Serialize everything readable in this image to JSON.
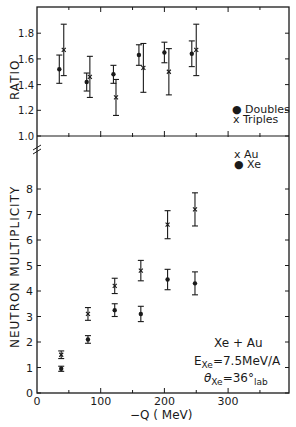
{
  "chart_data": [
    {
      "type": "scatter",
      "panel": "top",
      "title": "",
      "xlabel": "-Q (MeV)",
      "ylabel": "RATIO",
      "xlim": [
        0,
        400
      ],
      "ylim": [
        1.0,
        1.95
      ],
      "yticks": [
        "1.0",
        "1.2",
        "1.4",
        "1.6",
        "1.8"
      ],
      "grid": false,
      "legend": {
        "position": "lower right",
        "entries": [
          "Doubles",
          "Triples"
        ]
      },
      "series": [
        {
          "name": "Doubles",
          "marker": "o",
          "x": [
            35,
            78,
            120,
            160,
            200,
            243
          ],
          "y": [
            1.52,
            1.42,
            1.48,
            1.63,
            1.65,
            1.64
          ],
          "err": [
            0.11,
            0.07,
            0.07,
            0.08,
            0.08,
            0.1
          ]
        },
        {
          "name": "Triples",
          "marker": "x",
          "x": [
            42,
            83,
            124,
            167,
            207,
            250
          ],
          "y": [
            1.67,
            1.46,
            1.3,
            1.53,
            1.5,
            1.67
          ],
          "err": [
            0.2,
            0.16,
            0.14,
            0.19,
            0.18,
            0.2
          ]
        }
      ]
    },
    {
      "type": "scatter",
      "panel": "bottom",
      "title": "",
      "xlabel": "-Q (MeV)",
      "ylabel": "NEUTRON MULTIPLICITY",
      "xlim": [
        0,
        400
      ],
      "ylim": [
        0,
        9
      ],
      "xticks": [
        "0",
        "100",
        "200",
        "300"
      ],
      "yticks": [
        "0",
        "1",
        "2",
        "3",
        "4",
        "5",
        "6",
        "7",
        "8"
      ],
      "grid": false,
      "legend": {
        "position": "upper right",
        "entries": [
          "Au",
          "Xe"
        ]
      },
      "annotations": [
        "Xe + Au",
        "E_Xe = 7.5 MeV/A",
        "θ_Xe = 36° lab"
      ],
      "series": [
        {
          "name": "Au",
          "marker": "x",
          "x": [
            38,
            80,
            122,
            163,
            205,
            248
          ],
          "y": [
            1.5,
            3.1,
            4.2,
            4.8,
            6.6,
            7.2
          ],
          "err": [
            0.15,
            0.25,
            0.3,
            0.4,
            0.55,
            0.65
          ]
        },
        {
          "name": "Xe",
          "marker": "o",
          "x": [
            38,
            80,
            122,
            163,
            205,
            248
          ],
          "y": [
            0.95,
            2.1,
            3.25,
            3.1,
            4.45,
            4.3
          ],
          "err": [
            0.1,
            0.15,
            0.25,
            0.3,
            0.4,
            0.45
          ]
        }
      ]
    }
  ],
  "labels": {
    "top_ylabel": "RATIO",
    "bottom_ylabel": "NEUTRON  MULTIPLICITY",
    "xlabel": "−Q ( MeV)",
    "legend_top": [
      "● Doubles",
      "x Triples"
    ],
    "legend_bottom": [
      "x Au",
      "● Xe"
    ],
    "annotation": {
      "line1": "Xe + Au",
      "line2_main": "E",
      "line2_sub": "Xe",
      "line2_rest": "=7.5MeV/A",
      "line3_main": "θ",
      "line3_sub": "Xe",
      "line3_rest": "=36°",
      "line3_sub2": "lab"
    }
  }
}
